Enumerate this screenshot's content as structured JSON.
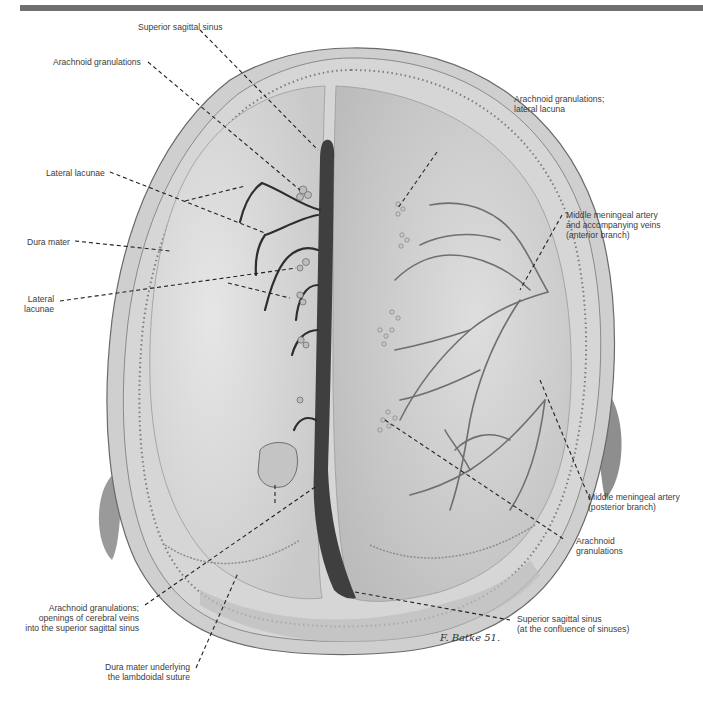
{
  "figure": {
    "view": "Superior view of dura mater and superior sagittal sinus (skull cap removed)",
    "signature": "F. Batke 51.",
    "colors": {
      "top_bar": "#6f6f6f",
      "dura": "#d9d9d9",
      "bone": "#c8c8c8",
      "sinus": "#3f3f3f",
      "vessel": "#7a7a7a",
      "leader_line": "#222222",
      "label_text": "#3c3c3c"
    }
  },
  "labels": {
    "superior_sagittal_sinus": {
      "lines": [
        "Superior sagittal sinus"
      ]
    },
    "arachnoid_granulations_top": {
      "lines": [
        "Arachnoid granulations"
      ]
    },
    "lateral_lacunae_top": {
      "lines": [
        "Lateral lacunae"
      ]
    },
    "dura_mater": {
      "lines": [
        "Dura mater"
      ]
    },
    "lateral_lacunae_left": {
      "lines": [
        "Lateral",
        "lacunae"
      ]
    },
    "arachnoid_granulations_lateral_lacuna": {
      "lines": [
        "Arachnoid granulations;",
        "lateral lacuna"
      ]
    },
    "middle_meningeal_anterior": {
      "lines": [
        "Middle meningeal artery",
        "and accompanying veins",
        "(anterior branch)"
      ]
    },
    "middle_meningeal_posterior": {
      "lines": [
        "Middle meningeal artery",
        "(posterior branch)"
      ]
    },
    "arachnoid_granulations_right": {
      "lines": [
        "Arachnoid",
        "granulations"
      ]
    },
    "arachnoid_openings": {
      "lines": [
        "Arachnoid granulations;",
        "openings of cerebral veins",
        "into the superior sagittal sinus"
      ]
    },
    "dura_lambdoidal": {
      "lines": [
        "Dura mater underlying",
        "the lambdoidal suture"
      ]
    },
    "sinus_confluence": {
      "lines": [
        "Superior sagittal sinus",
        "(at the confluence of sinuses)"
      ]
    }
  }
}
